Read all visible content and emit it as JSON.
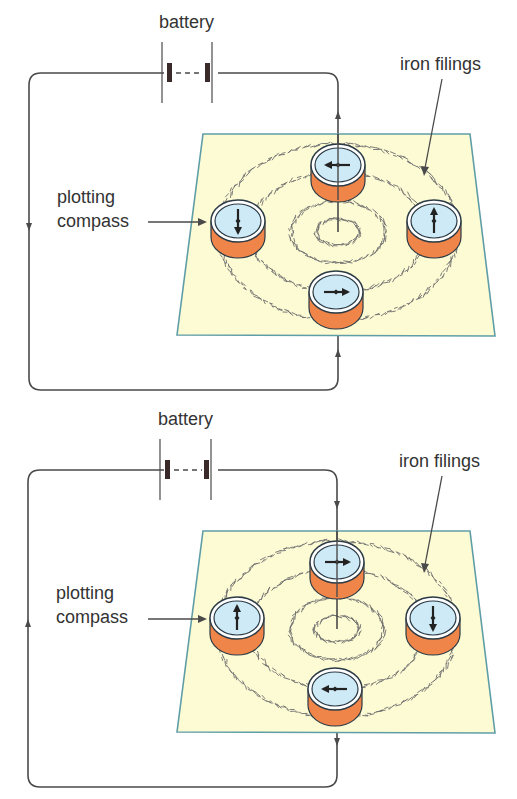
{
  "colors": {
    "wire": "#4a4a4a",
    "plane_fill": "#fdfbd4",
    "plane_border": "#5f9ea7",
    "compass_face": "#cfeaf7",
    "compass_rim": "#ffffff",
    "compass_outline": "#2b3a44",
    "compass_body": "#f0854a",
    "filings": "#6e6e6e",
    "needle": "#222222",
    "battery_plate": "#3a2a2a"
  },
  "diagrams": [
    {
      "id": "top",
      "labels": {
        "battery": "battery",
        "iron_filings": "iron filings",
        "plotting_line1": "plotting",
        "plotting_line2": "compass"
      },
      "offset_y": 0,
      "current_direction": "up",
      "compasses": [
        {
          "position": "top",
          "needle": "left"
        },
        {
          "position": "left",
          "needle": "down"
        },
        {
          "position": "right",
          "needle": "up"
        },
        {
          "position": "bottom",
          "needle": "right"
        }
      ]
    },
    {
      "id": "bottom",
      "labels": {
        "battery": "battery",
        "iron_filings": "iron filings",
        "plotting_line1": "plotting",
        "plotting_line2": "compass"
      },
      "offset_y": 397,
      "current_direction": "down",
      "compasses": [
        {
          "position": "top",
          "needle": "right"
        },
        {
          "position": "left",
          "needle": "up"
        },
        {
          "position": "right",
          "needle": "down"
        },
        {
          "position": "bottom",
          "needle": "left"
        }
      ]
    }
  ]
}
